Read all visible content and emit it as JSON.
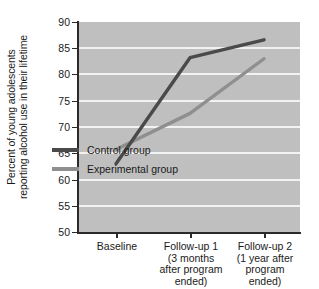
{
  "chart_data": {
    "type": "line",
    "title": "",
    "xlabel": "",
    "ylabel": "Percent of young adolescents reporting alcohol use in their lifetime",
    "ylabel_lines": [
      "Percent of young adolescents",
      "reporting alcohol use in their lifetime"
    ],
    "categories": [
      "Baseline",
      "Follow-up 1",
      "Follow-up 2"
    ],
    "category_sublabels": [
      [
        ""
      ],
      [
        "(3 months",
        "after program",
        "ended)"
      ],
      [
        "(1 year after",
        "program",
        "ended)"
      ]
    ],
    "ylim": [
      50,
      90
    ],
    "yticks": [
      90,
      85,
      80,
      75,
      70,
      65,
      60,
      55,
      50
    ],
    "ytick_labels": [
      "90",
      "85",
      "80",
      "75",
      "70",
      "65",
      "60",
      "55",
      "50"
    ],
    "grid": true,
    "legend_position": "inside-center",
    "series": [
      {
        "name": "Control group",
        "color": "#4a4a4a",
        "values": [
          63.0,
          83.2,
          86.6
        ]
      },
      {
        "name": "Experimental group",
        "color": "#8f8f8f",
        "values": [
          65.7,
          72.6,
          83.0
        ]
      }
    ]
  },
  "legend": {
    "items": [
      {
        "label": "Control group",
        "color": "#4a4a4a"
      },
      {
        "label": "Experimental group",
        "color": "#8f8f8f"
      }
    ]
  },
  "colors": {
    "plot_background": "#bfbfbf",
    "gridline": "#f2f2f2",
    "axis": "#2a2a2a",
    "control": "#4a4a4a",
    "experimental": "#8f8f8f"
  }
}
